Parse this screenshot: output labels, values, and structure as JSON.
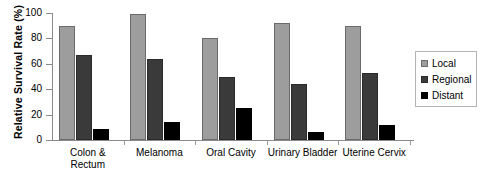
{
  "chart_data": {
    "type": "bar",
    "title": "",
    "xlabel": "",
    "ylabel": "Relative Survival Rate (%)",
    "ylim": [
      0,
      100
    ],
    "yticks": [
      0,
      20,
      40,
      60,
      80,
      100
    ],
    "grid": false,
    "legend_position": "right",
    "categories": [
      "Colon & Rectum",
      "Melanoma",
      "Oral Cavity",
      "Urinary Bladder",
      "Uterine Cervix"
    ],
    "category_lines": [
      [
        "Colon &",
        "Rectum"
      ],
      [
        "Melanoma"
      ],
      [
        "Oral Cavity"
      ],
      [
        "Urinary Bladder"
      ],
      [
        "Uterine Cervix"
      ]
    ],
    "series": [
      {
        "name": "Local",
        "color": "#9d9d9d",
        "values": [
          90,
          99,
          80,
          92,
          90
        ]
      },
      {
        "name": "Regional",
        "color": "#3a3a3a",
        "values": [
          67,
          64,
          50,
          44,
          53
        ]
      },
      {
        "name": "Distant",
        "color": "#000000",
        "values": [
          9,
          14,
          25,
          6,
          12
        ]
      }
    ]
  },
  "legend": {
    "items": [
      {
        "label": "Local"
      },
      {
        "label": "Regional"
      },
      {
        "label": "Distant"
      }
    ]
  }
}
